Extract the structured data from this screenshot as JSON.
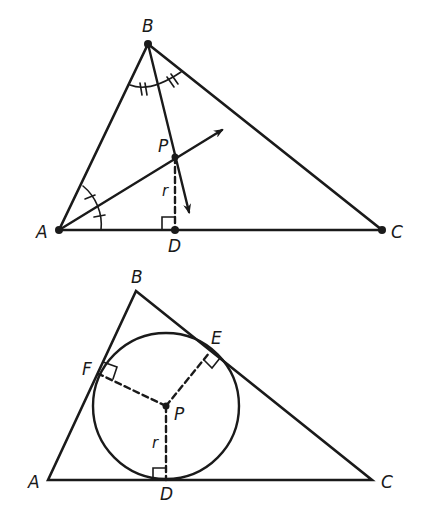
{
  "figures": [
    {
      "id": "angle-bisectors",
      "description": "Triangle ABC with angle bisectors from A and B meeting at P; perpendicular from P to AC at D with length r",
      "vertices": {
        "A": {
          "label": "A",
          "x": 59,
          "y": 230
        },
        "B": {
          "label": "B",
          "x": 148,
          "y": 44
        },
        "C": {
          "label": "C",
          "x": 382,
          "y": 230
        }
      },
      "points": {
        "P": {
          "label": "P",
          "x": 175,
          "y": 157
        },
        "D": {
          "label": "D",
          "x": 175,
          "y": 230
        }
      },
      "segment_label": "r"
    },
    {
      "id": "incircle",
      "description": "Triangle ABC with inscribed circle centered at P, tangent points D, E, F, radius r",
      "vertices": {
        "A": {
          "label": "A",
          "x": 48,
          "y": 480
        },
        "B": {
          "label": "B",
          "x": 136,
          "y": 291
        },
        "C": {
          "label": "C",
          "x": 372,
          "y": 480
        }
      },
      "points": {
        "P": {
          "label": "P",
          "x": 166,
          "y": 406
        },
        "D": {
          "label": "D",
          "x": 166,
          "y": 480
        },
        "E": {
          "label": "E",
          "x": 210,
          "y": 352
        },
        "F": {
          "label": "F",
          "x": 99,
          "y": 374
        }
      },
      "circle": {
        "cx": 166,
        "cy": 406,
        "r": 73
      },
      "segment_label": "r"
    }
  ]
}
